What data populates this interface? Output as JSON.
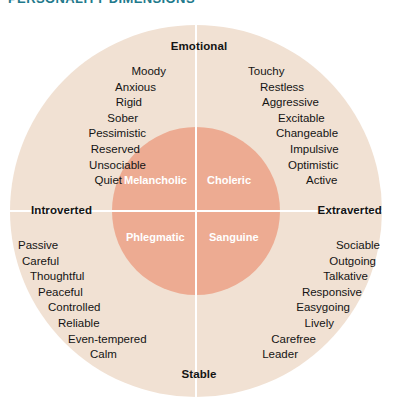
{
  "header": {
    "title": "PERSONALITY DIMENSIONS"
  },
  "colors": {
    "outer_circle": "#f1e1d3",
    "inner_circle": "#edab92",
    "axis_line": "#ffffff",
    "text": "#141414",
    "inner_label_text": "#ffffff",
    "header_title": "#1f7a8c",
    "background": "#ffffff"
  },
  "chart_data": {
    "type": "scatter",
    "title": "PERSONALITY DIMENSIONS",
    "subtitle": "",
    "xlabel": "",
    "ylabel": "",
    "grid": false,
    "legend_position": "none",
    "axes": {
      "horizontal": {
        "negative_pole": "Introverted",
        "positive_pole": "Extraverted"
      },
      "vertical": {
        "positive_pole": "Emotional",
        "negative_pole": "Stable"
      }
    },
    "quadrants": [
      {
        "name": "Melancholic",
        "position": "top-left",
        "axis_combination": "Emotional + Introverted",
        "traits": [
          "Moody",
          "Anxious",
          "Rigid",
          "Sober",
          "Pessimistic",
          "Reserved",
          "Unsociable",
          "Quiet"
        ]
      },
      {
        "name": "Choleric",
        "position": "top-right",
        "axis_combination": "Emotional + Extraverted",
        "traits": [
          "Touchy",
          "Restless",
          "Aggressive",
          "Excitable",
          "Changeable",
          "Impulsive",
          "Optimistic",
          "Active"
        ]
      },
      {
        "name": "Phlegmatic",
        "position": "bottom-left",
        "axis_combination": "Stable + Introverted",
        "traits": [
          "Passive",
          "Careful",
          "Thoughtful",
          "Peaceful",
          "Controlled",
          "Reliable",
          "Even-tempered",
          "Calm"
        ]
      },
      {
        "name": "Sanguine",
        "position": "bottom-right",
        "axis_combination": "Stable + Extraverted",
        "traits": [
          "Sociable",
          "Outgoing",
          "Talkative",
          "Responsive",
          "Easygoing",
          "Lively",
          "Carefree",
          "Leader"
        ]
      }
    ]
  }
}
